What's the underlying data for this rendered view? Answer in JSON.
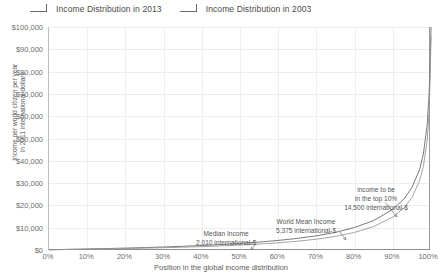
{
  "legend": {
    "items": [
      {
        "label": "Income Distribution in 2013",
        "marker": "line-step-icon"
      },
      {
        "label": "Income Distribution in 2003",
        "marker": "line-step-icon"
      }
    ]
  },
  "axes": {
    "y_title_line1": "Income per world citizen per year",
    "y_title_line2": "in 2011 international dollars",
    "x_title": "Position in the global income distribution",
    "y_ticks": [
      "$0",
      "$10,000",
      "$20,000",
      "$30,000",
      "$40,000",
      "$50,000",
      "$60,000",
      "$70,000",
      "$80,000",
      "$90,000",
      "$100,000"
    ],
    "x_ticks": [
      "0%",
      "10%",
      "20%",
      "30%",
      "40%",
      "50%",
      "60%",
      "70%",
      "80%",
      "90%",
      "100%"
    ]
  },
  "annotations": [
    {
      "id": "top10",
      "line1": "income to be",
      "line2": "in the top 10%",
      "line3": "14,500 international-$"
    },
    {
      "id": "mean",
      "line1": "World Mean Income",
      "line2": "5,375 international-$"
    },
    {
      "id": "median",
      "line1": "Median Income",
      "line2": "2,010 international-$"
    }
  ],
  "colors": {
    "series": "#6b6b6b",
    "grid": "#ededf2",
    "axis": "#8d8d8d",
    "text": "#5c5c5c"
  },
  "chart_data": {
    "type": "line",
    "title": "",
    "xlabel": "Position in the global income distribution",
    "ylabel": "Income per world citizen per year in 2011 international dollars",
    "xlim": [
      0,
      100
    ],
    "ylim": [
      0,
      100000
    ],
    "grid": true,
    "legend_position": "top-left",
    "x": [
      0,
      5,
      10,
      15,
      20,
      25,
      30,
      35,
      40,
      45,
      50,
      55,
      60,
      65,
      70,
      75,
      80,
      85,
      90,
      93,
      95,
      97,
      98,
      99,
      99.5,
      99.8,
      100
    ],
    "series": [
      {
        "name": "Income Distribution in 2013",
        "values": [
          120,
          290,
          470,
          650,
          850,
          1090,
          1360,
          1660,
          2010,
          2430,
          2950,
          3560,
          4300,
          5200,
          6350,
          7900,
          10100,
          13200,
          18200,
          23000,
          28000,
          36000,
          43000,
          56000,
          70000,
          85000,
          100000
        ]
      },
      {
        "name": "Income Distribution in 2003",
        "values": [
          95,
          225,
          360,
          500,
          650,
          830,
          1030,
          1260,
          1520,
          1830,
          2210,
          2670,
          3230,
          3930,
          4850,
          6100,
          7900,
          10500,
          14800,
          19000,
          23500,
          31000,
          37500,
          49000,
          62000,
          78000,
          96000
        ]
      }
    ],
    "annotations": [
      {
        "text": "Median Income 2,010 international-$",
        "x": 50,
        "y": 2010
      },
      {
        "text": "World Mean Income 5,375 international-$",
        "x": 68,
        "y": 5375
      },
      {
        "text": "income to be in the top 10%: 14,500 international-$",
        "x": 90,
        "y": 14500
      }
    ]
  }
}
